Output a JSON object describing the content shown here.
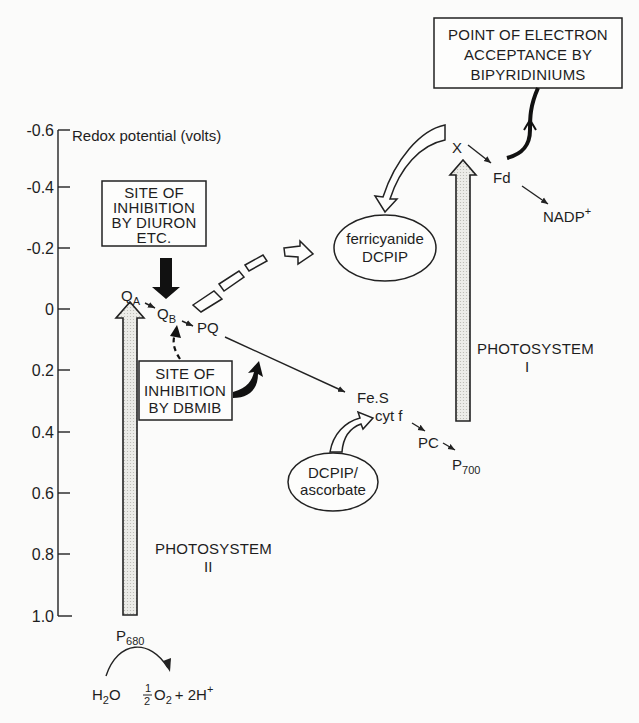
{
  "axis": {
    "title": "Redox potential (volts)",
    "ticks": [
      "-0.6",
      "-0.4",
      "-0.2",
      "0",
      "0.2",
      "0.4",
      "0.6",
      "0.8",
      "1.0"
    ]
  },
  "photosystem2": {
    "label": "PHOTOSYSTEM",
    "numeral": "II",
    "donor": "P",
    "donor_sub": "680"
  },
  "photosystem1": {
    "label": "PHOTOSYSTEM",
    "numeral": "I",
    "donor": "P",
    "donor_sub": "700"
  },
  "carriers": {
    "qa": "Q",
    "qa_sub": "A",
    "qb": "Q",
    "qb_sub": "B",
    "pq": "PQ",
    "fes": "Fe.S",
    "cytf": "cyt f",
    "pc": "PC",
    "x": "X",
    "fd": "Fd",
    "nadp": "NADP",
    "nadp_sup": "+"
  },
  "water": {
    "h2o": "H",
    "h2o_sub": "2",
    "h2o_end": "O",
    "half_num": "1",
    "half_den": "2",
    "o2": "O",
    "o2_sub": "2",
    "protons": "+ 2H",
    "protons_sup": "+"
  },
  "boxes": {
    "diuron": [
      "SITE OF",
      "INHIBITION",
      "BY DIURON",
      "ETC."
    ],
    "dbmib": [
      "SITE OF",
      "INHIBITION",
      "BY DBMIB"
    ],
    "bipyridinium": [
      "POINT OF ELECTRON",
      "ACCEPTANCE BY",
      "BIPYRIDINIUMS"
    ]
  },
  "ovals": {
    "acceptor": [
      "ferricyanide",
      "DCPIP"
    ],
    "donor": [
      "DCPIP/",
      "ascorbate"
    ]
  }
}
